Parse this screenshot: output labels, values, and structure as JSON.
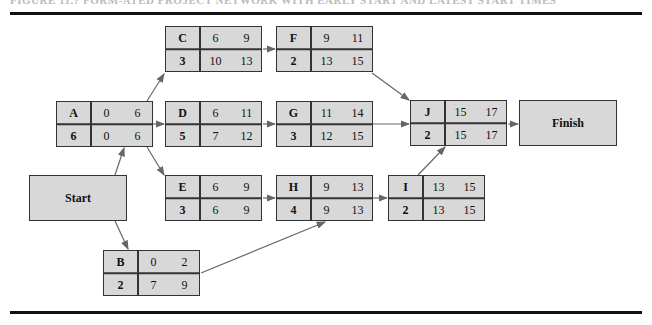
{
  "figure": {
    "caption": "FIGURE 11.? FORM-ATED PROJECT NETWORK WITH EARLY START AND LATEST START TIMES",
    "start_label": "Start",
    "finish_label": "Finish",
    "colors": {
      "node_fill": "#d8d8d8",
      "border": "#333333",
      "arrow": "#666666",
      "rule": "#111111"
    }
  },
  "nodes": {
    "A": {
      "name": "A",
      "top_a": "0",
      "top_b": "6",
      "bottom_name": "6",
      "bottom_a": "0",
      "bottom_b": "6"
    },
    "B": {
      "name": "B",
      "top_a": "0",
      "top_b": "2",
      "bottom_name": "2",
      "bottom_a": "7",
      "bottom_b": "9"
    },
    "C": {
      "name": "C",
      "top_a": "6",
      "top_b": "9",
      "bottom_name": "3",
      "bottom_a": "10",
      "bottom_b": "13"
    },
    "D": {
      "name": "D",
      "top_a": "6",
      "top_b": "11",
      "bottom_name": "5",
      "bottom_a": "7",
      "bottom_b": "12"
    },
    "E": {
      "name": "E",
      "top_a": "6",
      "top_b": "9",
      "bottom_name": "3",
      "bottom_a": "6",
      "bottom_b": "9"
    },
    "F": {
      "name": "F",
      "top_a": "9",
      "top_b": "11",
      "bottom_name": "2",
      "bottom_a": "13",
      "bottom_b": "15"
    },
    "G": {
      "name": "G",
      "top_a": "11",
      "top_b": "14",
      "bottom_name": "3",
      "bottom_a": "12",
      "bottom_b": "15"
    },
    "H": {
      "name": "H",
      "top_a": "9",
      "top_b": "13",
      "bottom_name": "4",
      "bottom_a": "9",
      "bottom_b": "13"
    },
    "I": {
      "name": "I",
      "top_a": "13",
      "top_b": "15",
      "bottom_name": "2",
      "bottom_a": "13",
      "bottom_b": "15"
    },
    "J": {
      "name": "J",
      "top_a": "15",
      "top_b": "17",
      "bottom_name": "2",
      "bottom_a": "15",
      "bottom_b": "17"
    }
  },
  "edges": [
    [
      "Start",
      "A"
    ],
    [
      "Start",
      "B"
    ],
    [
      "A",
      "C"
    ],
    [
      "A",
      "D"
    ],
    [
      "A",
      "E"
    ],
    [
      "C",
      "F"
    ],
    [
      "D",
      "G"
    ],
    [
      "E",
      "H"
    ],
    [
      "B",
      "H"
    ],
    [
      "F",
      "J"
    ],
    [
      "G",
      "J"
    ],
    [
      "H",
      "I"
    ],
    [
      "I",
      "J"
    ],
    [
      "J",
      "Finish"
    ]
  ]
}
